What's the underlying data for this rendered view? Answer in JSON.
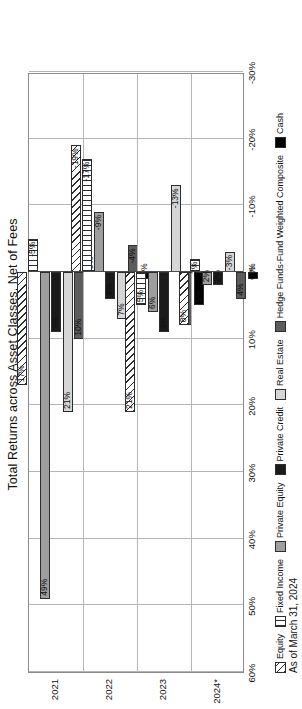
{
  "chart_data": {
    "type": "bar",
    "orientation": "horizontal-grouped",
    "title": "Total Returns across Asset Classes, Net of Fees",
    "footnote": "As of March 31, 2024",
    "xlabel": "",
    "ylabel": "",
    "xlim": [
      -30,
      60
    ],
    "grid": true,
    "legend_position": "bottom",
    "tick_labels": [
      "60%",
      "50%",
      "40%",
      "30%",
      "20%",
      "10%",
      "0%",
      "-10%",
      "-20%",
      "-30%"
    ],
    "tick_values": [
      60,
      50,
      40,
      30,
      20,
      10,
      0,
      -10,
      -20,
      -30
    ],
    "categories": [
      "2021",
      "2022",
      "2023",
      "2024*"
    ],
    "series": [
      {
        "name": "Equity",
        "fill": "equity",
        "color": "#ffffff",
        "pattern": "diagonal-hatch",
        "values": [
          17,
          -19,
          21,
          8
        ],
        "labels": [
          "17%",
          "-19%",
          "21%",
          "8%"
        ]
      },
      {
        "name": "Fixed Income",
        "fill": "fixed",
        "color": "#ffffff",
        "pattern": "vertical-lines",
        "values": [
          -5,
          -17,
          5,
          -2
        ],
        "labels": [
          "-5%",
          "-17%",
          "5%",
          "-2%"
        ]
      },
      {
        "name": "Private Equity",
        "fill": "pe",
        "color": "#9e9e9e",
        "pattern": "solid",
        "values": [
          49,
          -9,
          6,
          2
        ],
        "labels": [
          "49%",
          "-9%",
          "6%",
          "2%"
        ]
      },
      {
        "name": "Private Credit",
        "fill": "pc",
        "color": "#1b1b1b",
        "pattern": "solid",
        "values": [
          9,
          4,
          9,
          2
        ],
        "labels": [
          "9%",
          "4%",
          "9%",
          "2%"
        ]
      },
      {
        "name": "Real Estate",
        "fill": "re",
        "color": "#d6d6d6",
        "pattern": "solid",
        "values": [
          21,
          7,
          -13,
          -3
        ],
        "labels": [
          "21%",
          "7%",
          "-13%",
          "-3%"
        ]
      },
      {
        "name": "Hedge Funds-Fund Weighted Composite",
        "fill": "hf",
        "color": "#5c5c5c",
        "pattern": "solid",
        "values": [
          10,
          -4,
          8,
          4
        ],
        "labels": [
          "10%",
          "-4%",
          "8%",
          "4%"
        ]
      },
      {
        "name": "Cash",
        "fill": "cash",
        "color": "#000000",
        "pattern": "solid",
        "values": [
          0,
          1,
          5,
          1
        ],
        "labels": [
          "0%",
          "1%",
          "5%",
          "1%"
        ]
      }
    ]
  }
}
